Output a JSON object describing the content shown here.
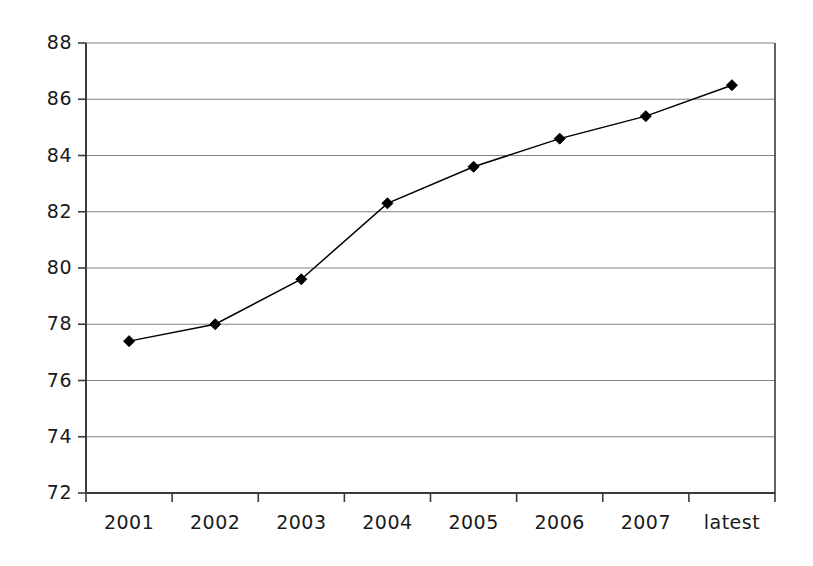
{
  "chart_data": {
    "type": "line",
    "title": "",
    "subtitle": "",
    "xlabel": "",
    "ylabel": "",
    "categories": [
      "2001",
      "2002",
      "2003",
      "2004",
      "2005",
      "2006",
      "2007",
      "latest"
    ],
    "values": [
      77.4,
      78.0,
      79.6,
      82.3,
      83.6,
      84.6,
      85.4,
      86.5
    ],
    "series": [
      {
        "name": "",
        "values": [
          77.4,
          78.0,
          79.6,
          82.3,
          83.6,
          84.6,
          85.4,
          86.5
        ]
      }
    ],
    "ylim": [
      72,
      88
    ],
    "ytick_labels": [
      "72",
      "74",
      "76",
      "78",
      "80",
      "82",
      "84",
      "86",
      "88"
    ],
    "ytick_values": [
      72,
      74,
      76,
      78,
      80,
      82,
      84,
      86,
      88
    ],
    "xtick_labels": [
      "2001",
      "2002",
      "2003",
      "2004",
      "2005",
      "2006",
      "2007",
      "latest"
    ],
    "grid": true,
    "grid_axis": "y",
    "legend": false,
    "legend_position": "none",
    "marker": "diamond",
    "marker_color": "#000000",
    "line_color": "#000000",
    "grid_color": "#808080",
    "axis_color": "#3a3a3a",
    "background_color": "#ffffff",
    "annotations": []
  },
  "figure": {
    "plot_left": 86,
    "plot_right": 775,
    "plot_top": 43,
    "plot_bottom": 493
  }
}
